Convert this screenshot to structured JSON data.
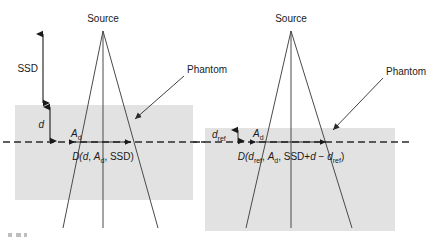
{
  "figure": {
    "background_color": "#ffffff",
    "phantom_color": "#e2e2e2",
    "line_color": "#4a4a4a",
    "text_color": "#1a1a1a"
  },
  "left_panel": {
    "source_label": "Source",
    "ssd_label": "SSD",
    "depth_label": "d",
    "field_area_label": "A",
    "field_area_sub": "d",
    "phantom_label": "Phantom",
    "dose_expression": {
      "prefix": "D(",
      "arg1": "d",
      "sep1": ", ",
      "arg2": "A",
      "arg2_sub": "d",
      "sep2": ", ",
      "arg3": "SSD",
      "suffix": ")"
    }
  },
  "right_panel": {
    "source_label": "Source",
    "depth_label": "d",
    "depth_sub": "ref",
    "field_area_label": "A",
    "field_area_sub": "d",
    "phantom_label": "Phantom",
    "dose_expression": {
      "prefix": "D(",
      "arg1": "d",
      "arg1_sub": "ref",
      "sep1": ", ",
      "arg2": "A",
      "arg2_sub": "d",
      "sep2": ", ",
      "arg3": "SSD+",
      "arg3b": "d",
      "minus": " − ",
      "arg3c": "d",
      "arg3c_sub": "ref",
      "suffix": ")"
    }
  },
  "icons": {
    "up_down_arrow": "ssd-dimension-arrow",
    "depth_arrow": "depth-dimension-arrow",
    "field_arrow": "field-width-arrow",
    "leader_arrow": "phantom-leader-arrow"
  }
}
